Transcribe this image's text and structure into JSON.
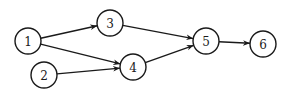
{
  "diagram": {
    "type": "directed-graph",
    "colors": {
      "stroke": "#1a1a1a",
      "fill": "#ffffff",
      "background": "#ffffff"
    },
    "node_radius": 13,
    "nodes": [
      {
        "id": "1",
        "label": "1",
        "x": 28,
        "y": 41
      },
      {
        "id": "2",
        "label": "2",
        "x": 44,
        "y": 75
      },
      {
        "id": "3",
        "label": "3",
        "x": 110,
        "y": 23
      },
      {
        "id": "4",
        "label": "4",
        "x": 133,
        "y": 67
      },
      {
        "id": "5",
        "label": "5",
        "x": 206,
        "y": 41
      },
      {
        "id": "6",
        "label": "6",
        "x": 263,
        "y": 44
      }
    ],
    "edges": [
      {
        "from": "1",
        "to": "3"
      },
      {
        "from": "1",
        "to": "4"
      },
      {
        "from": "2",
        "to": "4"
      },
      {
        "from": "3",
        "to": "5"
      },
      {
        "from": "4",
        "to": "5"
      },
      {
        "from": "5",
        "to": "6"
      }
    ]
  }
}
